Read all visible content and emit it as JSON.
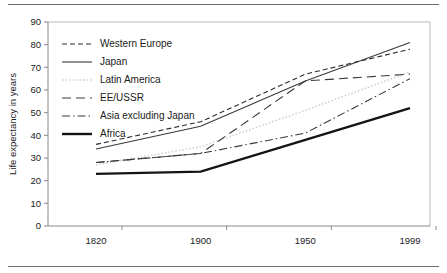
{
  "chart_data": {
    "type": "line",
    "title": "",
    "subtitle": "",
    "xlabel": "",
    "ylabel": "Life expectancy in years",
    "categories": [
      "1820",
      "1900",
      "1950",
      "1999"
    ],
    "x": [
      1820,
      1900,
      1950,
      1999
    ],
    "ylim": [
      0,
      90
    ],
    "yticks": [
      0,
      10,
      20,
      30,
      40,
      50,
      60,
      70,
      80,
      90
    ],
    "ytick_labels": [
      "0",
      "10",
      "20",
      "30",
      "40",
      "50",
      "60",
      "70",
      "80",
      "90"
    ],
    "xtick_labels": [
      "1820",
      "1900",
      "1950",
      "1999"
    ],
    "grid": false,
    "legend_position": "upper-left-inside",
    "series": [
      {
        "name": "Western Europe",
        "values": [
          36,
          46,
          67,
          78
        ],
        "style": "dashed",
        "color": "#2b2b2b",
        "width": 1.1,
        "dash": "5,3"
      },
      {
        "name": "Japan",
        "values": [
          34,
          44,
          64,
          81
        ],
        "style": "solid",
        "color": "#3a3a3a",
        "width": 1.1,
        "dash": "none"
      },
      {
        "name": "Latin America",
        "values": [
          27,
          35,
          51,
          68
        ],
        "style": "dotted",
        "color": "#cfcfcf",
        "width": 1.6,
        "dash": "1.5,2"
      },
      {
        "name": "EE/USSR",
        "values": [
          28,
          32,
          64,
          67
        ],
        "style": "long-dashed",
        "color": "#3a3a3a",
        "width": 1.1,
        "dash": "9,5"
      },
      {
        "name": "Asia excluding Japan",
        "values": [
          28,
          32,
          41,
          65
        ],
        "style": "dash-dot",
        "color": "#3a3a3a",
        "width": 1.1,
        "dash": "8,3,1.5,3"
      },
      {
        "name": "Africa",
        "values": [
          23,
          24,
          38,
          52
        ],
        "style": "solid-thick",
        "color": "#141414",
        "width": 2.4,
        "dash": "none"
      }
    ]
  }
}
